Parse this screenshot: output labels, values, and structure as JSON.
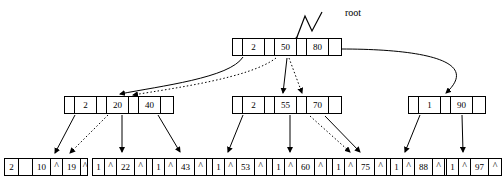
{
  "diagram": {
    "type": "b-plus-tree",
    "root_label": "root",
    "levels": [
      {
        "name": "root-level",
        "nodes": [
          {
            "id": "root-node",
            "x": 232,
            "y": 38,
            "w": 110,
            "h": 18,
            "cells": [
              {
                "type": "ptr",
                "text": "",
                "w": 10
              },
              {
                "type": "key",
                "text": "2",
                "w": 22
              },
              {
                "type": "ptr",
                "text": "",
                "w": 10
              },
              {
                "type": "key",
                "text": "50",
                "w": 22
              },
              {
                "type": "ptr",
                "text": "",
                "w": 10
              },
              {
                "type": "key",
                "text": "80",
                "w": 22
              },
              {
                "type": "ptr",
                "text": "",
                "w": 14
              }
            ]
          }
        ]
      },
      {
        "name": "internal-level",
        "nodes": [
          {
            "id": "internal-node-left",
            "x": 64,
            "y": 96,
            "w": 110,
            "h": 18,
            "cells": [
              {
                "type": "ptr",
                "text": "",
                "w": 10
              },
              {
                "type": "key",
                "text": "2",
                "w": 22
              },
              {
                "type": "ptr",
                "text": "",
                "w": 10
              },
              {
                "type": "key",
                "text": "20",
                "w": 22
              },
              {
                "type": "ptr",
                "text": "",
                "w": 10
              },
              {
                "type": "key",
                "text": "40",
                "w": 22
              },
              {
                "type": "ptr",
                "text": "",
                "w": 14
              }
            ]
          },
          {
            "id": "internal-node-middle",
            "x": 232,
            "y": 96,
            "w": 110,
            "h": 18,
            "cells": [
              {
                "type": "ptr",
                "text": "",
                "w": 10
              },
              {
                "type": "key",
                "text": "2",
                "w": 22
              },
              {
                "type": "ptr",
                "text": "",
                "w": 10
              },
              {
                "type": "key",
                "text": "55",
                "w": 22
              },
              {
                "type": "ptr",
                "text": "",
                "w": 10
              },
              {
                "type": "key",
                "text": "70",
                "w": 22
              },
              {
                "type": "ptr",
                "text": "",
                "w": 14
              }
            ]
          },
          {
            "id": "internal-node-right",
            "x": 408,
            "y": 96,
            "w": 78,
            "h": 18,
            "cells": [
              {
                "type": "ptr",
                "text": "",
                "w": 10
              },
              {
                "type": "key",
                "text": "1",
                "w": 22
              },
              {
                "type": "ptr",
                "text": "",
                "w": 10
              },
              {
                "type": "key",
                "text": "90",
                "w": 22
              },
              {
                "type": "ptr",
                "text": "",
                "w": 14
              }
            ]
          }
        ]
      },
      {
        "name": "leaf-level",
        "nodes": [
          {
            "id": "leaf-node-1",
            "x": 4,
            "y": 158,
            "w": 84,
            "h": 18,
            "cells": [
              {
                "type": "key",
                "text": "2",
                "w": 14
              },
              {
                "type": "ptr",
                "text": "",
                "w": 14
              },
              {
                "type": "key",
                "text": "10",
                "w": 18
              },
              {
                "type": "caret",
                "text": "^",
                "w": 12
              },
              {
                "type": "key",
                "text": "19",
                "w": 18
              },
              {
                "type": "caret",
                "text": "^",
                "w": 8
              }
            ]
          },
          {
            "id": "leaf-node-2",
            "x": 92,
            "y": 158,
            "w": 62,
            "h": 18,
            "cells": [
              {
                "type": "key",
                "text": "1",
                "w": 12
              },
              {
                "type": "caret",
                "text": "^",
                "w": 12
              },
              {
                "type": "key",
                "text": "22",
                "w": 18
              },
              {
                "type": "caret",
                "text": "^",
                "w": 12
              },
              {
                "type": "ptr",
                "text": "",
                "w": 8
              }
            ]
          },
          {
            "id": "leaf-node-3",
            "x": 152,
            "y": 158,
            "w": 62,
            "h": 18,
            "cells": [
              {
                "type": "key",
                "text": "1",
                "w": 12
              },
              {
                "type": "caret",
                "text": "^",
                "w": 12
              },
              {
                "type": "key",
                "text": "43",
                "w": 18
              },
              {
                "type": "caret",
                "text": "^",
                "w": 12
              },
              {
                "type": "ptr",
                "text": "",
                "w": 8
              }
            ]
          },
          {
            "id": "leaf-node-4",
            "x": 212,
            "y": 158,
            "w": 62,
            "h": 18,
            "cells": [
              {
                "type": "key",
                "text": "1",
                "w": 12
              },
              {
                "type": "caret",
                "text": "^",
                "w": 12
              },
              {
                "type": "key",
                "text": "53",
                "w": 18
              },
              {
                "type": "caret",
                "text": "^",
                "w": 12
              },
              {
                "type": "ptr",
                "text": "",
                "w": 8
              }
            ]
          },
          {
            "id": "leaf-node-5",
            "x": 272,
            "y": 158,
            "w": 62,
            "h": 18,
            "cells": [
              {
                "type": "key",
                "text": "1",
                "w": 12
              },
              {
                "type": "caret",
                "text": "^",
                "w": 12
              },
              {
                "type": "key",
                "text": "60",
                "w": 18
              },
              {
                "type": "caret",
                "text": "^",
                "w": 12
              },
              {
                "type": "ptr",
                "text": "",
                "w": 8
              }
            ]
          },
          {
            "id": "leaf-node-6",
            "x": 332,
            "y": 158,
            "w": 62,
            "h": 18,
            "cells": [
              {
                "type": "key",
                "text": "1",
                "w": 12
              },
              {
                "type": "caret",
                "text": "^",
                "w": 12
              },
              {
                "type": "key",
                "text": "75",
                "w": 18
              },
              {
                "type": "caret",
                "text": "^",
                "w": 12
              },
              {
                "type": "ptr",
                "text": "",
                "w": 8
              }
            ]
          },
          {
            "id": "leaf-node-7",
            "x": 390,
            "y": 158,
            "w": 62,
            "h": 18,
            "cells": [
              {
                "type": "key",
                "text": "1",
                "w": 12
              },
              {
                "type": "caret",
                "text": "^",
                "w": 12
              },
              {
                "type": "key",
                "text": "88",
                "w": 18
              },
              {
                "type": "caret",
                "text": "^",
                "w": 12
              },
              {
                "type": "ptr",
                "text": "",
                "w": 8
              }
            ]
          },
          {
            "id": "leaf-node-8",
            "x": 446,
            "y": 158,
            "w": 56,
            "h": 18,
            "cells": [
              {
                "type": "key",
                "text": "1",
                "w": 12
              },
              {
                "type": "caret",
                "text": "^",
                "w": 12
              },
              {
                "type": "key",
                "text": "97",
                "w": 18
              },
              {
                "type": "caret",
                "text": "^",
                "w": 12
              }
            ]
          }
        ]
      }
    ],
    "colors": {
      "line": "#000000",
      "node_border": "#000000",
      "node_fill": "#ffffff",
      "text": "#000000",
      "background": "#ffffff"
    }
  }
}
